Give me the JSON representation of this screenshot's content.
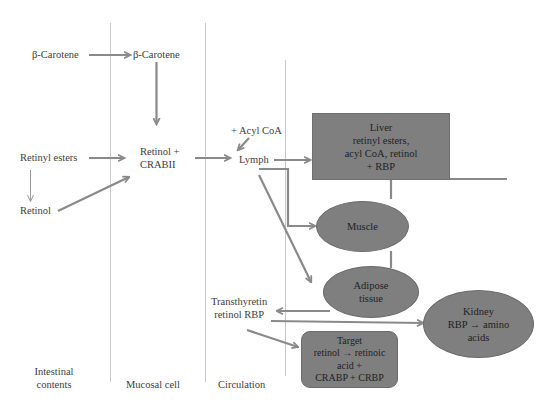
{
  "diagram": {
    "type": "flow-diagram",
    "colors": {
      "node_fill": "#7f7f7f",
      "arrow": "#8a8a8a",
      "divider": "#c8c8c8",
      "text": "#3d3d3d"
    },
    "columns": [
      {
        "id": "intestinal",
        "label_line1": "Intestinal",
        "label_line2": "contents"
      },
      {
        "id": "mucosal",
        "label": "Mucosal cell"
      },
      {
        "id": "circulation",
        "label": "Circulation"
      }
    ],
    "labels": {
      "beta_carotene_intestinal": "β-Carotene",
      "beta_carotene_mucosal": "β-Carotene",
      "retinyl_esters": "Retinyl esters",
      "retinol": "Retinol",
      "retinol_crabii_line1": "Retinol +",
      "retinol_crabii_line2": "CRABII",
      "acyl_coa": "+ Acyl CoA",
      "lymph": "Lymph",
      "transthyretin_line1": "Transthyretin",
      "transthyretin_line2": "retinol RBP"
    },
    "nodes": {
      "liver": {
        "lines": [
          "Liver",
          "retinyl esters,",
          "acyl CoA, retinol",
          "+ RBP"
        ]
      },
      "muscle": {
        "lines": [
          "Muscle"
        ]
      },
      "adipose": {
        "lines": [
          "Adipose",
          "tissue"
        ]
      },
      "kidney": {
        "lines": [
          "Kidney",
          "RBP → amino",
          "acids"
        ]
      },
      "target": {
        "lines": [
          "Target",
          "retinol → retinoic",
          "acid +",
          "CRABP + CRBP"
        ]
      }
    },
    "edges": [
      {
        "from": "β-Carotene (intestinal)",
        "to": "β-Carotene (mucosal)"
      },
      {
        "from": "β-Carotene (mucosal)",
        "to": "Retinol + CRABII"
      },
      {
        "from": "Retinyl esters",
        "to": "Retinol + CRABII"
      },
      {
        "from": "Retinyl esters",
        "to": "Retinol"
      },
      {
        "from": "Retinol",
        "to": "Retinol + CRABII"
      },
      {
        "from": "Retinol + CRABII",
        "to": "Lymph"
      },
      {
        "from": "+ Acyl CoA",
        "to": "Lymph"
      },
      {
        "from": "Lymph",
        "to": "Liver"
      },
      {
        "from": "Lymph",
        "to": "Muscle"
      },
      {
        "from": "Lymph",
        "to": "Adipose tissue"
      },
      {
        "from": "Liver",
        "to": "Transthyretin retinol RBP"
      },
      {
        "from": "Transthyretin retinol RBP",
        "to": "Kidney"
      },
      {
        "from": "Transthyretin retinol RBP",
        "to": "Target"
      }
    ]
  }
}
